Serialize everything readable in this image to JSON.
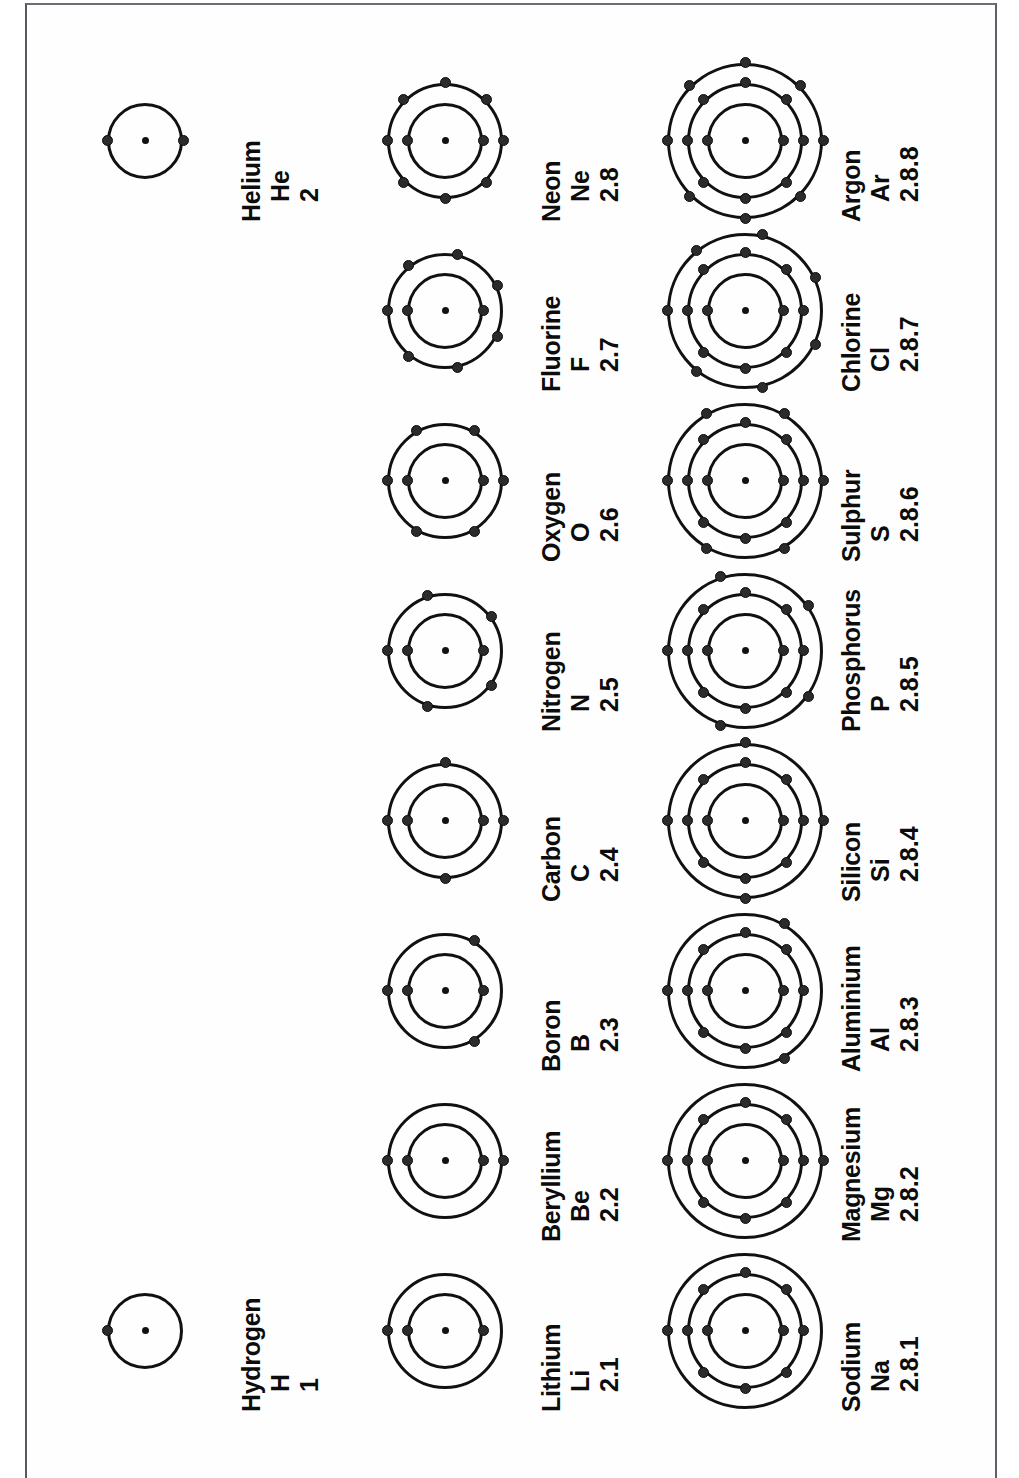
{
  "document": {
    "title": "Electron shell (Bohr) diagrams of the first 18 elements",
    "orientation": "landscape-figure-on-portrait-scan",
    "ink_color": "#111111",
    "paper_color": "#fefefe"
  },
  "chart_data": {
    "type": "diagram",
    "rows": [
      {
        "period": 1,
        "elements": [
          {
            "name": "Hydrogen",
            "symbol": "H",
            "config": "1",
            "shells": [
              1
            ]
          },
          {
            "name": "Helium",
            "symbol": "He",
            "config": "2",
            "shells": [
              2
            ]
          }
        ]
      },
      {
        "period": 2,
        "elements": [
          {
            "name": "Lithium",
            "symbol": "Li",
            "config": "2.1",
            "shells": [
              2,
              1
            ]
          },
          {
            "name": "Beryllium",
            "symbol": "Be",
            "config": "2.2",
            "shells": [
              2,
              2
            ]
          },
          {
            "name": "Boron",
            "symbol": "B",
            "config": "2.3",
            "shells": [
              2,
              3
            ]
          },
          {
            "name": "Carbon",
            "symbol": "C",
            "config": "2.4",
            "shells": [
              2,
              4
            ]
          },
          {
            "name": "Nitrogen",
            "symbol": "N",
            "config": "2.5",
            "shells": [
              2,
              5
            ]
          },
          {
            "name": "Oxygen",
            "symbol": "O",
            "config": "2.6",
            "shells": [
              2,
              6
            ]
          },
          {
            "name": "Fluorine",
            "symbol": "F",
            "config": "2.7",
            "shells": [
              2,
              7
            ]
          },
          {
            "name": "Neon",
            "symbol": "Ne",
            "config": "2.8",
            "shells": [
              2,
              8
            ]
          }
        ]
      },
      {
        "period": 3,
        "elements": [
          {
            "name": "Sodium",
            "symbol": "Na",
            "config": "2.8.1",
            "shells": [
              2,
              8,
              1
            ]
          },
          {
            "name": "Magnesium",
            "symbol": "Mg",
            "config": "2.8.2",
            "shells": [
              2,
              8,
              2
            ]
          },
          {
            "name": "Aluminium",
            "symbol": "Al",
            "config": "2.8.3",
            "shells": [
              2,
              8,
              3
            ]
          },
          {
            "name": "Silicon",
            "symbol": "Si",
            "config": "2.8.4",
            "shells": [
              2,
              8,
              4
            ]
          },
          {
            "name": "Phosphorus",
            "symbol": "P",
            "config": "2.8.5",
            "shells": [
              2,
              8,
              5
            ]
          },
          {
            "name": "Sulphur",
            "symbol": "S",
            "config": "2.8.6",
            "shells": [
              2,
              8,
              6
            ]
          },
          {
            "name": "Chlorine",
            "symbol": "Cl",
            "config": "2.8.7",
            "shells": [
              2,
              8,
              7
            ]
          },
          {
            "name": "Argon",
            "symbol": "Ar",
            "config": "2.8.8",
            "shells": [
              2,
              8,
              8
            ]
          }
        ]
      }
    ]
  }
}
